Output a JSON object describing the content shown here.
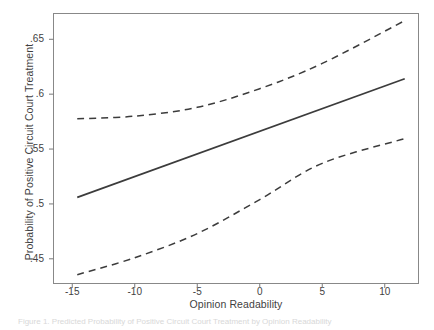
{
  "figure": {
    "caption": "Figure 1.  Predicted Probability of Positive Circuit Court Treatment by Opinion Readability"
  },
  "chart_data": {
    "type": "line",
    "title": "",
    "xlabel": "Opinion Readability",
    "ylabel": "Probability of Positive Circuit Court Treatment",
    "xlim": [
      -16.5,
      12.7
    ],
    "ylim": [
      0.4275,
      0.6735
    ],
    "grid": false,
    "legend": "none",
    "xticks": [
      -15,
      -10,
      -5,
      0,
      5,
      10
    ],
    "xtick_labels": [
      "-15",
      "-10",
      "-5",
      "0",
      "5",
      "10"
    ],
    "yticks": [
      0.65,
      0.6,
      0.55,
      0.5,
      0.45
    ],
    "ytick_labels": [
      ".65",
      ".6",
      ".55",
      ".5",
      ".45"
    ],
    "x": [
      -14.6,
      -12.0,
      -10.0,
      -8.0,
      -6.0,
      -4.0,
      -2.0,
      0.0,
      2.0,
      4.0,
      6.0,
      8.0,
      10.0,
      11.6
    ],
    "series": [
      {
        "name": "Predicted probability",
        "style": "solid",
        "color": "#3c3c3c",
        "values": [
          0.506,
          0.511,
          0.515,
          0.5192,
          0.5234,
          0.5276,
          0.5318,
          0.566,
          0.5722,
          0.579,
          0.587,
          0.596,
          0.606,
          0.614
        ]
      },
      {
        "name": "Upper 95% confidence bound",
        "style": "dashed",
        "color": "#3c3c3c",
        "values": [
          0.5775,
          0.5785,
          0.5795,
          0.5812,
          0.5838,
          0.588,
          0.595,
          0.6235,
          0.609,
          0.619,
          0.63,
          0.642,
          0.656,
          0.667
        ]
      },
      {
        "name": "Lower 95% confidence bound",
        "style": "dashed",
        "color": "#3c3c3c",
        "values": [
          0.4355,
          0.443,
          0.45,
          0.458,
          0.4665,
          0.476,
          0.4865,
          0.527,
          0.5345,
          0.542,
          0.548,
          0.553,
          0.557,
          0.5595
        ]
      }
    ],
    "series_solid": {
      "name": "Predicted probability",
      "points": [
        [
          -14.6,
          0.506
        ],
        [
          11.6,
          0.614
        ]
      ]
    },
    "series_upper": {
      "name": "Upper 95% confidence bound",
      "points": [
        [
          -14.6,
          0.5775
        ],
        [
          -10.0,
          0.58
        ],
        [
          -5.0,
          0.588
        ],
        [
          0.0,
          0.605
        ],
        [
          5.0,
          0.628
        ],
        [
          11.6,
          0.667
        ]
      ]
    },
    "series_lower": {
      "name": "Lower 95% confidence bound",
      "points": [
        [
          -14.6,
          0.4355
        ],
        [
          -10.0,
          0.451
        ],
        [
          -5.0,
          0.473
        ],
        [
          0.0,
          0.504
        ],
        [
          5.0,
          0.537
        ],
        [
          11.6,
          0.5595
        ]
      ]
    }
  }
}
